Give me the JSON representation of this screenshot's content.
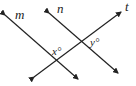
{
  "diagram": {
    "lines": [
      {
        "name": "m",
        "label": "m"
      },
      {
        "name": "n",
        "label": "n"
      },
      {
        "name": "t",
        "label": "t"
      }
    ],
    "angles": [
      {
        "label": "x°"
      },
      {
        "label": "y°"
      }
    ],
    "colors": {
      "stroke": "#222222",
      "background": "#ffffff"
    }
  }
}
